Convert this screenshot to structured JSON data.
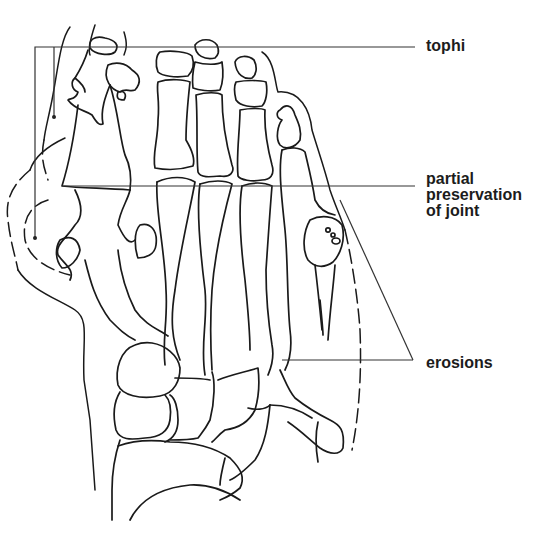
{
  "diagram": {
    "labels": {
      "tophi": "tophi",
      "partial_preservation_line1": "partial",
      "partial_preservation_line2": "preservation",
      "partial_preservation_line3": "of joint",
      "erosions": "erosions"
    },
    "colors": {
      "line": "#1a1a1a",
      "background": "#ffffff",
      "text": "#1c1c1c"
    }
  }
}
